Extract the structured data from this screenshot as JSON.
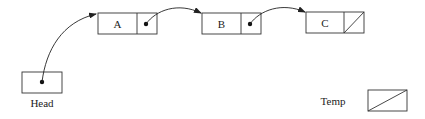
{
  "diagram": {
    "type": "singly-linked-list",
    "head": {
      "label": "Head",
      "points_to": "A"
    },
    "nodes": [
      {
        "id": "A",
        "value": "A",
        "next": "B"
      },
      {
        "id": "B",
        "value": "B",
        "next": "C"
      },
      {
        "id": "C",
        "value": "C",
        "next": null
      }
    ],
    "temp": {
      "label": "Temp",
      "value": null
    },
    "colors": {
      "stroke": "#333333",
      "text": "#222222",
      "background": "#ffffff"
    }
  }
}
